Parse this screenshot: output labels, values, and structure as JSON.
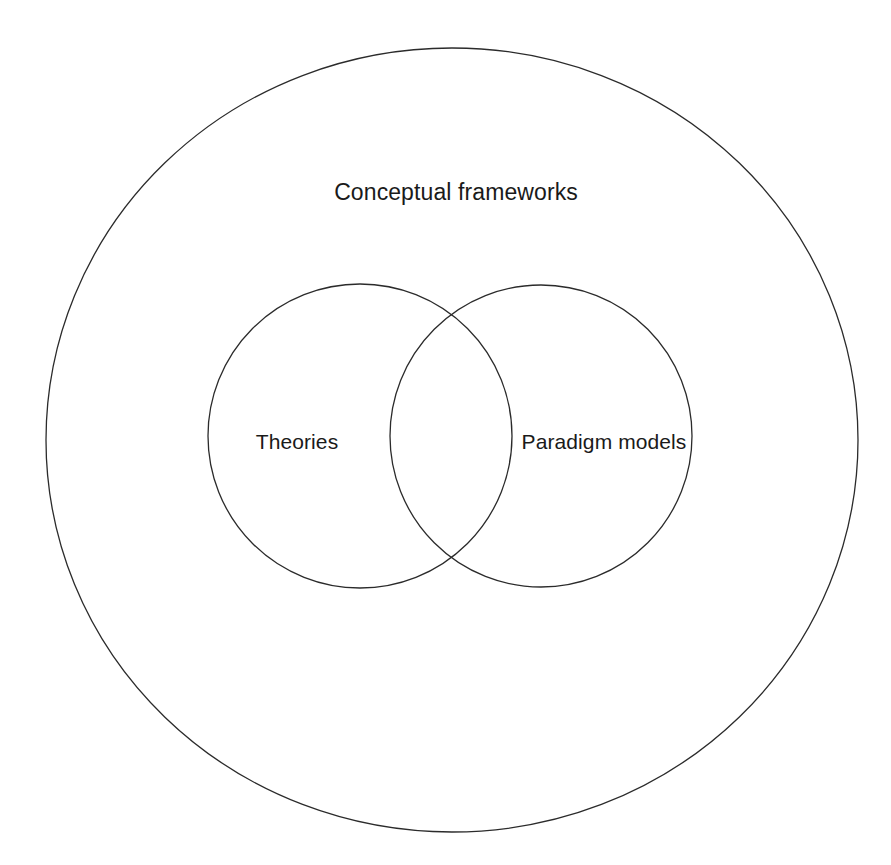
{
  "diagram": {
    "type": "nested-venn",
    "background_color": "#ffffff",
    "stroke_color": "#2b2b2b",
    "text_color": "#1a1a1a",
    "outer_set": {
      "label": "Conceptual frameworks",
      "label_position": "top-inside",
      "shape": "ellipse",
      "cx": 452,
      "cy": 440,
      "rx": 406,
      "ry": 392,
      "label_x": 456,
      "label_y": 200,
      "stroke_width": 1.3
    },
    "inner_sets": [
      {
        "label": "Theories",
        "shape": "circle",
        "cx": 360,
        "cy": 436,
        "r": 152,
        "label_x": 297,
        "label_y": 449,
        "stroke_width": 1.3
      },
      {
        "label": "Paradigm models",
        "shape": "circle",
        "cx": 541,
        "cy": 436,
        "r": 151,
        "label_x": 604,
        "label_y": 449,
        "stroke_width": 1.3
      }
    ],
    "intersection": {
      "label": "",
      "top_point_x": 450,
      "top_point_y": 317,
      "bottom_point_x": 450,
      "bottom_point_y": 561
    }
  }
}
